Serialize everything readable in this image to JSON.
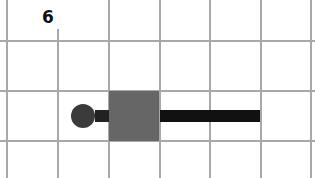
{
  "puzzle": {
    "number_label": "6",
    "grid": {
      "vertical_lines_x": [
        7,
        58,
        109,
        160,
        210,
        261,
        311
      ],
      "horizontal_lines_y": [
        41,
        91,
        141
      ],
      "line_color": "#a8a8a8"
    },
    "pieces": {
      "circle": {
        "cx": 83,
        "cy": 116,
        "r": 12,
        "color": "#3b3b3b"
      },
      "connector": {
        "x": 95,
        "y": 110,
        "w": 14,
        "h": 12,
        "color": "#222222"
      },
      "square": {
        "x": 109,
        "y": 91,
        "w": 50,
        "h": 50,
        "color": "#666666"
      },
      "bar": {
        "x": 160,
        "y": 110,
        "w": 100,
        "h": 12,
        "color": "#111111"
      }
    }
  }
}
